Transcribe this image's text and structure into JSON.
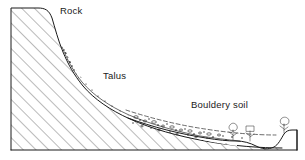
{
  "figure": {
    "background_color": "#ffffff",
    "ink_color": "#1a1a1a",
    "width": 305,
    "height": 160
  },
  "labels": [
    {
      "id": "rock",
      "text": "Rock",
      "x": 60,
      "y": 14
    },
    {
      "id": "talus",
      "text": "Talus",
      "x": 103,
      "y": 79
    },
    {
      "id": "bouldery_soil",
      "text": "Bouldery soil",
      "x": 191,
      "y": 108
    }
  ],
  "units": [
    {
      "id": "bedrock",
      "name": "Rock",
      "pattern": "diagonal-hatch",
      "hatch_angle_deg": 45,
      "hatch_spacing_px": 9,
      "description": "Massive hatched bedrock forming cliff and buried slope"
    },
    {
      "id": "talus",
      "name": "Talus",
      "pattern": "dense-stipple",
      "description": "Dark stippled angular debris wedge below the cliff face"
    },
    {
      "id": "bouldery_soil",
      "name": "Bouldery soil",
      "pattern": "sparse-boulders",
      "description": "Thin lower-slope layer with scattered boulders, dashed upper contact"
    }
  ],
  "vegetation": [
    {
      "id": "shrub-1",
      "x": 233,
      "y": 124
    },
    {
      "id": "shrub-2",
      "x": 250,
      "y": 124
    },
    {
      "id": "shrub-3",
      "x": 284,
      "y": 122
    }
  ],
  "frame": {
    "baseline_y": 150,
    "left_edge_x": 11,
    "right_edge_x": 297,
    "top_edge_y": 8
  }
}
